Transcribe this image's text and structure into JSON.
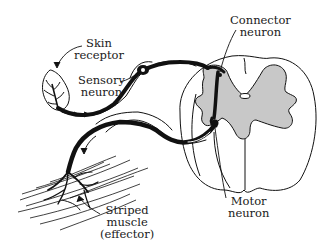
{
  "diagram": {
    "colors": {
      "ink": "#111111",
      "grey_matter": "#c8c8c8",
      "background": "#ffffff"
    },
    "labels": {
      "skin_receptor": {
        "line1": "Skin",
        "line2": "receptor"
      },
      "sensory_neuron": {
        "line1": "Sensory",
        "line2": "neuron"
      },
      "connector_neuron": {
        "line1": "Connector",
        "line2": "neuron"
      },
      "motor_neuron": {
        "line1": "Motor",
        "line2": "neuron"
      },
      "striped_muscle": {
        "line1": "Striped",
        "line2": "muscle",
        "line3": "(effector)"
      }
    }
  }
}
